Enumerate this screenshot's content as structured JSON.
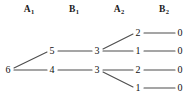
{
  "figure": {
    "type": "tree-diagram",
    "width": 192,
    "height": 98,
    "background_color": "#ffffff",
    "node_color": "#111111",
    "edge_color": "#4d4d4d"
  },
  "columns": [
    {
      "letter": "A",
      "index": "1",
      "x": 29
    },
    {
      "letter": "B",
      "index": "1",
      "x": 74
    },
    {
      "letter": "A",
      "index": "2",
      "x": 119
    },
    {
      "letter": "B",
      "index": "2",
      "x": 164
    }
  ],
  "nodes": [
    {
      "id": "root",
      "label": "6",
      "x": 8,
      "y": 70,
      "column": "root"
    },
    {
      "id": "a1-u",
      "label": "5",
      "x": 52,
      "y": 51,
      "column": "A1"
    },
    {
      "id": "a1-l",
      "label": "4",
      "x": 52,
      "y": 70,
      "column": "A1"
    },
    {
      "id": "b1-u",
      "label": "3",
      "x": 97,
      "y": 51,
      "column": "B1"
    },
    {
      "id": "b1-l",
      "label": "3",
      "x": 97,
      "y": 70,
      "column": "B1"
    },
    {
      "id": "a2-1",
      "label": "2",
      "x": 138,
      "y": 33,
      "column": "A2"
    },
    {
      "id": "a2-2",
      "label": "1",
      "x": 138,
      "y": 51,
      "column": "A2"
    },
    {
      "id": "a2-3",
      "label": "2",
      "x": 138,
      "y": 70,
      "column": "A2"
    },
    {
      "id": "a2-4",
      "label": "1",
      "x": 138,
      "y": 88,
      "column": "A2"
    },
    {
      "id": "b2-1",
      "label": "0",
      "x": 180,
      "y": 33,
      "column": "B2"
    },
    {
      "id": "b2-2",
      "label": "0",
      "x": 180,
      "y": 51,
      "column": "B2"
    },
    {
      "id": "b2-3",
      "label": "0",
      "x": 180,
      "y": 70,
      "column": "B2"
    },
    {
      "id": "b2-4",
      "label": "0",
      "x": 180,
      "y": 88,
      "column": "B2"
    }
  ],
  "edges": [
    {
      "from": "root",
      "to": "a1-u",
      "x1": 14,
      "y1": 68,
      "x2": 47,
      "y2": 52
    },
    {
      "from": "root",
      "to": "a1-l",
      "x1": 14,
      "y1": 70,
      "x2": 47,
      "y2": 70
    },
    {
      "from": "a1-u",
      "to": "b1-u",
      "x1": 58,
      "y1": 51,
      "x2": 92,
      "y2": 51
    },
    {
      "from": "a1-l",
      "to": "b1-l",
      "x1": 58,
      "y1": 70,
      "x2": 92,
      "y2": 70
    },
    {
      "from": "b1-u",
      "to": "a2-1",
      "x1": 103,
      "y1": 49,
      "x2": 133,
      "y2": 34
    },
    {
      "from": "b1-u",
      "to": "a2-2",
      "x1": 103,
      "y1": 51,
      "x2": 133,
      "y2": 51
    },
    {
      "from": "b1-l",
      "to": "a2-3",
      "x1": 103,
      "y1": 70,
      "x2": 133,
      "y2": 70
    },
    {
      "from": "b1-l",
      "to": "a2-4",
      "x1": 103,
      "y1": 72,
      "x2": 133,
      "y2": 87
    },
    {
      "from": "a2-1",
      "to": "b2-1",
      "x1": 144,
      "y1": 33,
      "x2": 175,
      "y2": 33
    },
    {
      "from": "a2-2",
      "to": "b2-2",
      "x1": 144,
      "y1": 51,
      "x2": 175,
      "y2": 51
    },
    {
      "from": "a2-3",
      "to": "b2-3",
      "x1": 144,
      "y1": 70,
      "x2": 175,
      "y2": 70
    },
    {
      "from": "a2-4",
      "to": "b2-4",
      "x1": 144,
      "y1": 88,
      "x2": 175,
      "y2": 88
    }
  ]
}
